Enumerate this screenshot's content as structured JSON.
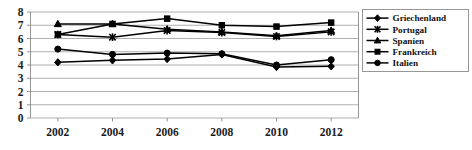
{
  "chart_data": {
    "type": "line",
    "title": "",
    "xlabel": "",
    "ylabel": "",
    "categories": [
      "2002",
      "2004",
      "2006",
      "2008",
      "2010",
      "2012"
    ],
    "x": [
      2002,
      2004,
      2006,
      2008,
      2010,
      2012
    ],
    "xlim": [
      2001,
      2013
    ],
    "ylim": [
      0,
      8
    ],
    "y_ticks": [
      0,
      1,
      2,
      3,
      4,
      5,
      6,
      7,
      8
    ],
    "y_tick_labels": [
      "0",
      "1",
      "2",
      "3",
      "4",
      "5",
      "6",
      "7",
      "8"
    ],
    "grid": true,
    "grid_axis": "y",
    "legend_position": "right",
    "series": [
      {
        "name": "Griechenland",
        "marker": "diamond",
        "color": "#000000",
        "values": [
          4.2,
          4.35,
          4.45,
          4.8,
          3.85,
          3.9
        ]
      },
      {
        "name": "Portugal",
        "marker": "x",
        "color": "#000000",
        "values": [
          6.3,
          6.1,
          6.6,
          6.45,
          6.15,
          6.5
        ]
      },
      {
        "name": "Spanien",
        "marker": "triangle",
        "color": "#000000",
        "values": [
          7.1,
          7.1,
          6.7,
          6.5,
          6.2,
          6.6
        ]
      },
      {
        "name": "Frankreich",
        "marker": "square",
        "color": "#000000",
        "values": [
          6.3,
          7.1,
          7.5,
          7.0,
          6.9,
          7.2
        ]
      },
      {
        "name": "Italien",
        "marker": "circle",
        "color": "#000000",
        "values": [
          5.2,
          4.8,
          4.9,
          4.85,
          4.0,
          4.4
        ]
      }
    ]
  },
  "legend": {
    "items": [
      {
        "label": "Griechenland",
        "marker": "diamond"
      },
      {
        "label": "Portugal",
        "marker": "x"
      },
      {
        "label": "Spanien",
        "marker": "triangle"
      },
      {
        "label": "Frankreich",
        "marker": "square"
      },
      {
        "label": "Italien",
        "marker": "circle"
      }
    ]
  },
  "axes": {
    "y_labels": [
      "8",
      "7",
      "6",
      "5",
      "4",
      "3",
      "2",
      "1",
      "0"
    ],
    "x_labels": [
      "2002",
      "2004",
      "2006",
      "2008",
      "2010",
      "2012"
    ]
  }
}
